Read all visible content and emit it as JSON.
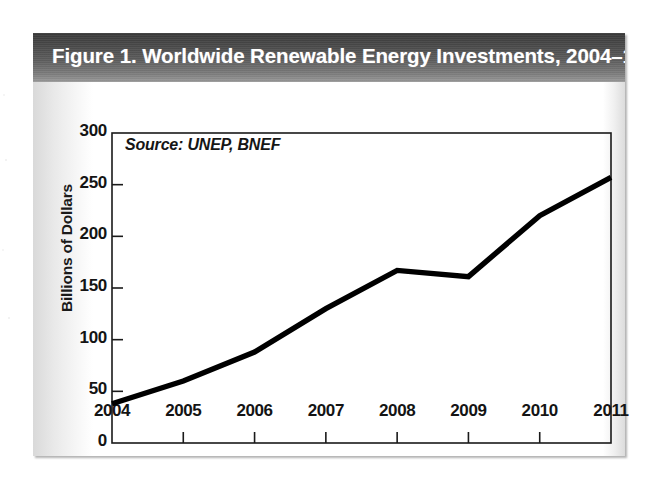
{
  "figure": {
    "title": "Figure 1. Worldwide Renewable Energy Investments,  2004–11",
    "source_note": "Source: UNEP, BNEF",
    "frame_color": "#1a1a1a",
    "line_color": "#000000",
    "title_bar_color": "#4a4a4a",
    "title_text_color": "#ffffff"
  },
  "chart_data": {
    "type": "line",
    "title": "Figure 1. Worldwide Renewable Energy Investments,  2004–11",
    "xlabel": "",
    "ylabel": "Billions of Dollars",
    "categories": [
      "2004",
      "2005",
      "2006",
      "2007",
      "2008",
      "2009",
      "2010",
      "2011"
    ],
    "x": [
      2004,
      2005,
      2006,
      2007,
      2008,
      2009,
      2010,
      2011
    ],
    "values": [
      38,
      60,
      88,
      130,
      167,
      161,
      220,
      257
    ],
    "series": [
      {
        "name": "Worldwide renewable energy investment",
        "values": [
          38,
          60,
          88,
          130,
          167,
          161,
          220,
          257
        ]
      }
    ],
    "ylim": [
      0,
      300
    ],
    "yticks": [
      0,
      50,
      100,
      150,
      200,
      250,
      300
    ],
    "ytick_labels": [
      "0",
      "50",
      "100",
      "150",
      "200",
      "250",
      "300"
    ],
    "xtick_labels": [
      "2004",
      "2005",
      "2006",
      "2007",
      "2008",
      "2009",
      "2010",
      "2011"
    ],
    "grid": false,
    "legend": false,
    "annotations": [
      "Source: UNEP, BNEF"
    ],
    "units": "Billions of Dollars"
  }
}
